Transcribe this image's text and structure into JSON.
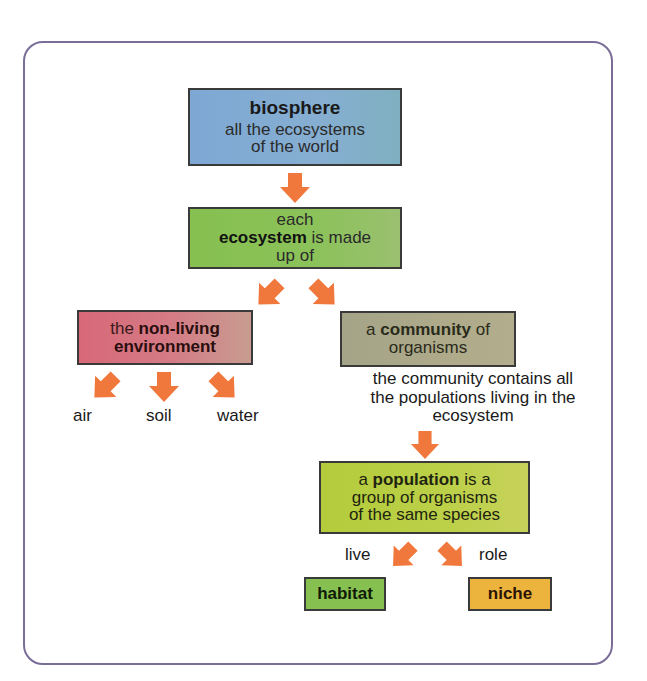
{
  "diagram": {
    "biosphere": {
      "title": "biosphere",
      "subtitle_line1": "all the ecosystems",
      "subtitle_line2": "of the world"
    },
    "ecosystem": {
      "line1": "each",
      "bold": "ecosystem",
      "line2_rest": " is made",
      "line3": "up of"
    },
    "nonliving": {
      "prefix": "the ",
      "bold1": "non-living",
      "bold2": "environment"
    },
    "community": {
      "prefix": "a ",
      "bold": "community",
      "suffix": " of",
      "line2": "organisms"
    },
    "community_description": {
      "line1": "the community contains all",
      "line2": "the populations living in the",
      "line3": "ecosystem"
    },
    "nonliving_items": [
      "air",
      "soil",
      "water"
    ],
    "population": {
      "prefix": "a ",
      "bold": "population",
      "suffix": " is a",
      "line2": "group of organisms",
      "line3": "of the same species"
    },
    "edge_labels": {
      "live": "live",
      "role": "role"
    },
    "habitat": "habitat",
    "niche": "niche"
  },
  "colors": {
    "arrow": "#f0783c",
    "frame": "#7a6e98",
    "biosphere": "#7ea8d4",
    "ecosystem": "#86c050",
    "nonliving": "#d86878",
    "community": "#a8a688",
    "population": "#b8ce42",
    "habitat": "#86c050",
    "niche": "#ecb43c"
  }
}
